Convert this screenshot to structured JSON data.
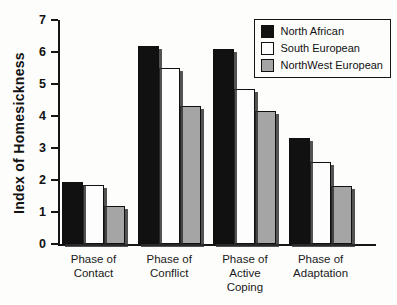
{
  "chart_data": {
    "type": "bar",
    "title": "",
    "ylabel": "Index of Homesickness",
    "xlabel": "",
    "ylim": [
      0,
      7
    ],
    "yticks": [
      0,
      1,
      2,
      3,
      4,
      5,
      6,
      7
    ],
    "grid": false,
    "legend_position": "top-right",
    "categories": [
      [
        "Phase of",
        "Contact"
      ],
      [
        "Phase of",
        "Conflict"
      ],
      [
        "Phase of",
        "Active",
        "Coping"
      ],
      [
        "Phase of",
        "Adaptation"
      ]
    ],
    "series": [
      {
        "name": "North African",
        "color": "#111111",
        "values": [
          1.95,
          6.2,
          6.1,
          3.3
        ]
      },
      {
        "name": "South European",
        "color": "#fdfdfd",
        "values": [
          1.85,
          5.5,
          4.85,
          2.55
        ]
      },
      {
        "name": "NorthWest European",
        "color": "#a5a5a5",
        "values": [
          1.2,
          4.3,
          4.15,
          1.8
        ]
      }
    ],
    "colors": {
      "axis": "#151515",
      "shadow": "#2d2d2d",
      "background": "#fdfdfc"
    }
  }
}
